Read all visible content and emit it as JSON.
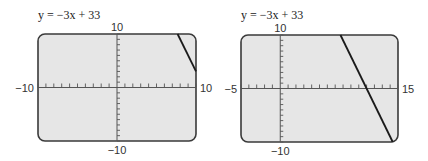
{
  "chart_data": [
    {
      "type": "line",
      "title": "y = −3x + 33",
      "equation": {
        "slope": -3,
        "intercept": 33
      },
      "xlim": [
        -10,
        10
      ],
      "ylim": [
        -10,
        10
      ],
      "xtick_step": 1,
      "ytick_step": 1,
      "tick_labels": {
        "xmin": "−10",
        "xmax": "10",
        "ymin": "−10",
        "ymax": "10"
      },
      "segment": {
        "x": [
          7.67,
          10
        ],
        "y": [
          10,
          3
        ]
      },
      "grid": false
    },
    {
      "type": "line",
      "title": "y = −3x + 33",
      "equation": {
        "slope": -3,
        "intercept": 33
      },
      "xlim": [
        -5,
        15
      ],
      "ylim": [
        -10,
        10
      ],
      "xtick_step": 1,
      "ytick_step": 1,
      "tick_labels": {
        "xmin": "−5",
        "xmax": "15",
        "ymin": "−10",
        "ymax": "10"
      },
      "segment": {
        "x": [
          7.67,
          14.33
        ],
        "y": [
          10,
          -10
        ]
      },
      "grid": false
    }
  ],
  "panels": [
    {
      "equation_label": "y = −3x + 33",
      "xmin": "−10",
      "xmax": "10",
      "ymin": "−10",
      "ymax": "10"
    },
    {
      "equation_label": "y = −3x + 33",
      "xmin": "−5",
      "xmax": "15",
      "ymin": "−10",
      "ymax": "10"
    }
  ]
}
